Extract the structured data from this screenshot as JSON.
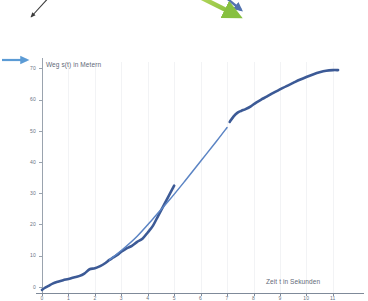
{
  "chart_data": {
    "type": "line",
    "title": "",
    "xlabel": "Zeit t in Sekunden",
    "ylabel": "Weg s(t) in Metern",
    "xlim": [
      0,
      11.5
    ],
    "ylim": [
      -2,
      72
    ],
    "grid": "vertical-faint",
    "legend": "none",
    "x_ticks": [
      0,
      1,
      2,
      3,
      4,
      5,
      6,
      7,
      8,
      9,
      10,
      11
    ],
    "x_tick_labels": [
      "0",
      "1",
      "2",
      "3",
      "4",
      "5",
      "6",
      "7",
      "8",
      "9",
      "10",
      "11"
    ],
    "y_ticks": [
      0,
      10,
      20,
      30,
      40,
      50,
      60,
      70
    ],
    "y_tick_labels": [
      "0",
      "10",
      "20",
      "30",
      "40",
      "50",
      "60",
      "70"
    ],
    "series": [
      {
        "name": "Messkurve Weg s(t)",
        "color": "#3c5a96",
        "style": "thick-solid",
        "x": [
          0.0,
          0.1,
          0.25,
          0.4,
          0.6,
          0.8,
          1.0,
          1.2,
          1.4,
          1.6,
          1.8,
          2.0,
          2.2,
          2.4,
          2.55,
          2.7,
          2.85,
          3.0,
          3.2,
          3.4,
          3.6,
          3.8,
          4.0,
          4.2,
          4.4,
          4.6,
          4.8,
          5.0
        ],
        "y": [
          -1.0,
          -0.4,
          0.3,
          1.0,
          1.6,
          2.1,
          2.5,
          3.0,
          3.4,
          4.2,
          5.6,
          5.9,
          6.6,
          7.6,
          8.6,
          9.4,
          10.2,
          11.2,
          12.3,
          13.1,
          14.4,
          15.4,
          17.4,
          19.6,
          22.8,
          26.0,
          29.2,
          32.4
        ]
      },
      {
        "name": "Ausgleichsgerade (linearer Abschnitt)",
        "color": "#5b84c4",
        "style": "thin-solid",
        "x": [
          2.55,
          3.0,
          3.6,
          4.2,
          4.8,
          5.4,
          6.0,
          6.6,
          7.0
        ],
        "y": [
          8.6,
          11.6,
          16.2,
          21.8,
          27.6,
          33.8,
          40.2,
          46.6,
          51.0
        ]
      },
      {
        "name": "Messkurve Weg s(t) (Fortsetzung)",
        "color": "#3c5a96",
        "style": "thick-solid",
        "x": [
          7.1,
          7.25,
          7.4,
          7.55,
          7.7,
          7.9,
          8.1,
          8.3,
          8.5,
          8.75,
          9.0,
          9.25,
          9.5,
          9.75,
          10.0,
          10.25,
          10.5,
          10.75,
          11.0,
          11.2
        ],
        "y": [
          52.8,
          54.6,
          55.8,
          56.4,
          56.9,
          57.8,
          59.0,
          60.0,
          60.9,
          62.1,
          63.2,
          64.3,
          65.3,
          66.3,
          67.2,
          68.0,
          68.7,
          69.2,
          69.4,
          69.4
        ]
      }
    ],
    "annotations": [
      {
        "name": "arrow-black-topleft",
        "color": "#3a3a3a",
        "description": "thin black arrow pointing down-left",
        "label": ""
      },
      {
        "name": "arrow-green-topcenter",
        "color": "#8cc63f",
        "description": "green arrow pointing down-right",
        "label": ""
      },
      {
        "name": "arrow-navy-topcenter",
        "color": "#3c5a96",
        "description": "navy arrow pointing down-right behind green arrow",
        "label": ""
      },
      {
        "name": "arrow-blue-left",
        "color": "#5b9bd5",
        "description": "light blue arrow pointing right toward y-axis title",
        "label": ""
      }
    ]
  }
}
